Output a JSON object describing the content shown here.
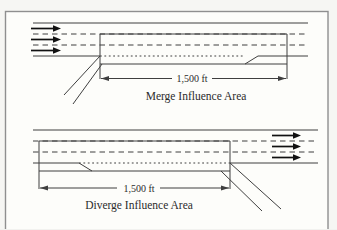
{
  "figure": {
    "type": "freeway-ramp-influence-area-diagram",
    "merge": {
      "title": "Merge Influence Area",
      "dimension_label": "1,500 ft"
    },
    "diverge": {
      "title": "Diverge Influence Area",
      "dimension_label": "1,500 ft"
    }
  },
  "colors": {
    "line": "#3f3f3f",
    "flow_arrow": "#111111",
    "frame_border": "#8f8f8f",
    "text": "#2b2b2b",
    "background": "#fdfdfa"
  }
}
